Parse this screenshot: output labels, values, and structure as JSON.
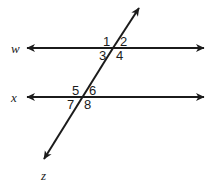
{
  "figure": {
    "background_color": "#ffffff",
    "stroke_color": "#1b1b1b",
    "line_labels": {
      "parallel_top": "w",
      "parallel_bottom": "x",
      "transversal": "z"
    },
    "angle_labels": {
      "upper_intersection": {
        "top_left": "1",
        "top_right": "2",
        "bottom_left": "3",
        "bottom_right": "4"
      },
      "lower_intersection": {
        "top_left": "5",
        "top_right": "6",
        "bottom_left": "7",
        "bottom_right": "8"
      }
    }
  }
}
